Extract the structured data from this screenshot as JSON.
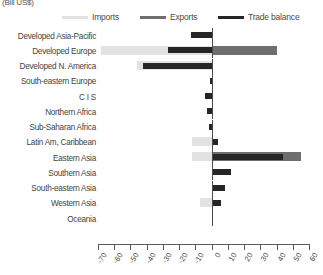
{
  "unit_label": "(Bill US$)",
  "legend": {
    "items": [
      {
        "label": "Imports",
        "color": "#e2e2e2",
        "x": 62
      },
      {
        "label": "Exports",
        "color": "#6e6e6e",
        "x": 140
      },
      {
        "label": "Trade balance",
        "color": "#262626",
        "x": 218
      }
    ]
  },
  "colors": {
    "imports": "#e2e2e2",
    "exports": "#6e6e6e",
    "balance": "#262626",
    "axis": "#5a5a5a"
  },
  "chart_data": {
    "type": "bar",
    "orientation": "horizontal",
    "title": "",
    "subtitle": "",
    "xlabel": "(Bill US$)",
    "ylabel": "",
    "xlim": [
      -70,
      60
    ],
    "xticks": [
      -70,
      -60,
      -50,
      -40,
      -30,
      -20,
      -10,
      0,
      10,
      20,
      30,
      40,
      50,
      60
    ],
    "xtick_labels": [
      "-70",
      "-60",
      "-50",
      "-40",
      "-30",
      "-20",
      "-10",
      "0",
      "10",
      "20",
      "30",
      "40",
      "50",
      "60"
    ],
    "grid": false,
    "legend_position": "top",
    "categories": [
      "Developed Asia-Pacific",
      "Developed Europe",
      "Developed N. America",
      "South-eastern Europe",
      "C I S",
      "Northern Africa",
      "Sub-Saharan Africa",
      "Latin Am, Caribbean",
      "Eastern Asia",
      "Southern Asia",
      "South-eastern Asia",
      "Western Asia",
      "Oceania"
    ],
    "series": [
      {
        "name": "Imports",
        "color": "#e2e2e2",
        "values": [
          0,
          -68,
          -46,
          0,
          0,
          0,
          0,
          -12,
          -12,
          0,
          0,
          -7,
          0
        ]
      },
      {
        "name": "Exports",
        "color": "#6e6e6e",
        "values": [
          0,
          40,
          0,
          0,
          0,
          0,
          0,
          0,
          55,
          0,
          0,
          0,
          0
        ]
      },
      {
        "name": "Trade balance",
        "color": "#262626",
        "values": [
          -13,
          -27,
          -42,
          -1,
          -4,
          -3,
          -1.5,
          4,
          44,
          12,
          8,
          6,
          0
        ]
      }
    ]
  }
}
